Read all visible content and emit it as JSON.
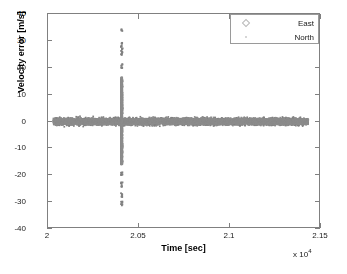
{
  "figure": {
    "background": "#ffffff",
    "axes_color": "#808080"
  },
  "axis": {
    "xlabel": "Time [sec]",
    "ylabel": "Velocity error [m/s]",
    "x_exponent_prefix": "x 10",
    "x_exponent_power": "4",
    "xticks": [
      "2",
      "2.05",
      "2.1",
      "2.15"
    ],
    "yticks": [
      "40",
      "30",
      "20",
      "10",
      "0",
      "-10",
      "-20",
      "-30",
      "-40"
    ]
  },
  "legend": {
    "entries": [
      {
        "label": "East",
        "marker": "diamond-marker-icon",
        "color": "#b9b9b9"
      },
      {
        "label": "North",
        "marker": "dot-marker-icon",
        "color": "#c8c8c8"
      }
    ]
  },
  "chart_data": {
    "type": "scatter",
    "title": "",
    "xlabel": "Time [sec]",
    "ylabel": "Velocity error [m/s]",
    "xlim": [
      20000,
      21500
    ],
    "ylim": [
      -40,
      40
    ],
    "x_tick_values": [
      20000,
      20500,
      21000,
      21500
    ],
    "y_tick_values": [
      40,
      30,
      20,
      10,
      0,
      -10,
      -20,
      -30,
      -40
    ],
    "x_axis_multiplier": 10000,
    "grid": false,
    "legend_position": "upper right",
    "marker_color": "#808080",
    "series": [
      {
        "name": "East",
        "marker": "diamond",
        "color": "#808080",
        "description": "Dense noise band centered on 0 m/s spanning the full record, with a large transient spike near t = 20405 s.",
        "noise_band": {
          "x_start": 20030,
          "x_end": 21430,
          "y_center": 0.0,
          "y_spread": 1.4
        },
        "spike": {
          "x": 20405,
          "y_max": 34,
          "y_min": -31,
          "outlier_values": [
            34,
            29,
            28,
            27,
            26,
            25,
            21,
            20,
            16,
            15,
            14,
            13,
            12,
            11,
            10,
            9,
            8,
            7,
            6,
            5,
            4,
            3,
            -3,
            -4,
            -5,
            -6,
            -7,
            -8,
            -9,
            -14,
            -15,
            -19,
            -20,
            -23,
            -24,
            -27,
            -28,
            -30,
            -31
          ]
        }
      },
      {
        "name": "North",
        "marker": "point",
        "color": "#8c8c8c",
        "description": "Dense noise band centered on 0 m/s overlapping the East series, with coincident transient spike at the same epoch.",
        "noise_band": {
          "x_start": 20030,
          "x_end": 21430,
          "y_center": 0.0,
          "y_spread": 1.2
        },
        "spike": {
          "x": 20405,
          "y_max": 16,
          "y_min": -9,
          "outlier_values": [
            16,
            15,
            13,
            12,
            11,
            9,
            8,
            6,
            5,
            4,
            3,
            -3,
            -4,
            -5,
            -6,
            -7,
            -8,
            -9
          ]
        }
      }
    ]
  }
}
